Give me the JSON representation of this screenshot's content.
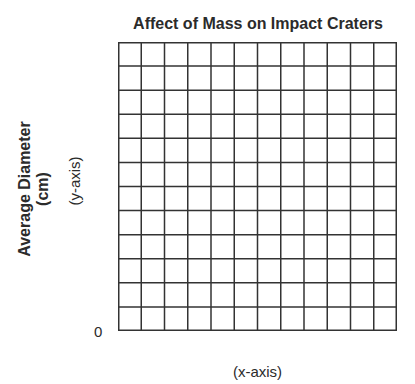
{
  "chart_data": {
    "type": "table",
    "title": "Affect of Mass on Impact Craters",
    "xlabel": "(x-axis)",
    "ylabel": "Average Diameter (cm)",
    "ylabel_line1": "Average Diameter",
    "ylabel_line2": "(cm)",
    "ylabel_hint": "(y-axis)",
    "origin_label": "0",
    "grid": true,
    "grid_columns": 12,
    "grid_rows": 12,
    "series": [],
    "categories": [],
    "values": [],
    "note": "Blank graph grid with no plotted data"
  }
}
